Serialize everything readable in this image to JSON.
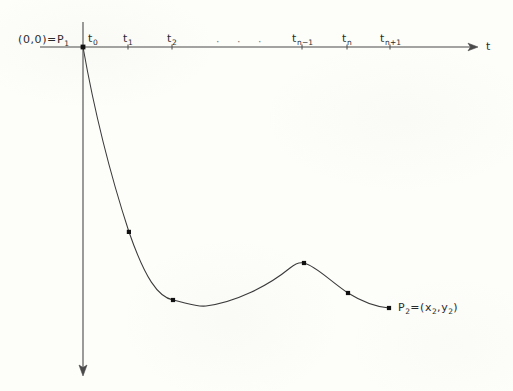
{
  "figure": {
    "caption_none": "",
    "background_color": "#fdfdfa",
    "ink_color": "#3a3a3a",
    "axes": {
      "horizontal": {
        "name": "t-axis",
        "label": "t",
        "x_start": 40,
        "x_end": 478,
        "y": 47,
        "arrow": "right"
      },
      "vertical": {
        "name": "vertical-axis",
        "label": "",
        "x": 83,
        "y_start": 22,
        "y_end": 375,
        "arrow": "down"
      }
    },
    "origin_label": "(0,0)=P",
    "origin_label_sub": "1",
    "origin_point": {
      "x": 83,
      "y": 47
    },
    "ellipsis": "· · ·",
    "ticks": [
      {
        "label": "t",
        "sub": "0",
        "x": 83,
        "name": "tick-t0"
      },
      {
        "label": "t",
        "sub": "1",
        "x": 128,
        "name": "tick-t1"
      },
      {
        "label": "t",
        "sub": "2",
        "x": 172,
        "name": "tick-t2"
      },
      {
        "label": "t",
        "sub": "n−1",
        "x": 302,
        "name": "tick-tn-1"
      },
      {
        "label": "t",
        "sub": "n",
        "x": 347,
        "name": "tick-tn"
      },
      {
        "label": "t",
        "sub": "n+1",
        "x": 390,
        "name": "tick-tn+1"
      }
    ],
    "endpoint_label": "P",
    "endpoint_label_sub": "2",
    "endpoint_label_rest": "=(x",
    "endpoint_label_sub2": "2",
    "endpoint_label_rest2": ",y",
    "endpoint_label_sub3": "2",
    "endpoint_label_rest3": ")",
    "endpoint_label_full": "P₂=(x₂,y₂)"
  },
  "chart_data": {
    "type": "line",
    "title": "",
    "xlabel": "t",
    "ylabel": "",
    "grid": false,
    "legend": "none",
    "axis_ticks_x": [
      "t0",
      "t1",
      "t2",
      "...",
      "tn-1",
      "tn",
      "tn+1"
    ],
    "tick_pixel_x": [
      83,
      128,
      172,
      302,
      347,
      390
    ],
    "curve_points": [
      {
        "x": 83,
        "y": 47,
        "marked": true,
        "label": "P1"
      },
      {
        "x": 129,
        "y": 232,
        "marked": true,
        "label": ""
      },
      {
        "x": 173,
        "y": 300,
        "marked": true,
        "label": ""
      },
      {
        "x": 200,
        "y": 307,
        "marked": false,
        "label": ""
      },
      {
        "x": 250,
        "y": 285,
        "marked": false,
        "label": ""
      },
      {
        "x": 304,
        "y": 263,
        "marked": true,
        "label": ""
      },
      {
        "x": 348,
        "y": 293,
        "marked": true,
        "label": ""
      },
      {
        "x": 389,
        "y": 308,
        "marked": true,
        "label": "P2"
      }
    ],
    "path_d": "M 83 47 C 95 115, 112 180, 129 232 C 145 278, 158 297, 173 300 C 190 304, 196 307, 206 306 C 236 302, 268 286, 290 268 C 296 263, 300 262, 304 263 C 316 266, 330 281, 348 293 C 364 303, 378 307, 389 308"
  }
}
